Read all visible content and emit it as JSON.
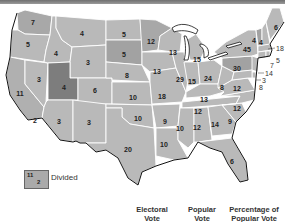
{
  "map": {
    "title": "",
    "colors": {
      "state_light": "#b9b9b9",
      "state_medium": "#a4a4a4",
      "state_dark": "#7d7d7d",
      "border": "#ffffff",
      "coastline": "#111111"
    },
    "states": {
      "WA": "7",
      "OR": "5",
      "CA": "11",
      "CA_divided": "2",
      "NV": "3",
      "ID": "4",
      "MT": "4",
      "WY": "3",
      "UT": "4",
      "CO": "6",
      "AZ": "3",
      "NM": "3",
      "ND": "5",
      "SD": "5",
      "NE": "8",
      "KS": "10",
      "OK": "10",
      "TX": "20",
      "MN": "12",
      "IA": "13",
      "MO": "18",
      "AR": "9",
      "LA": "10",
      "WI": "13",
      "IL": "29",
      "MI": "15",
      "IN": "15",
      "OH": "24",
      "KY": "13",
      "TN": "12",
      "MS": "10",
      "AL": "12",
      "GA": "14",
      "FL": "6",
      "SC": "9",
      "NC": "12",
      "VA": "12",
      "WV": "8",
      "PA": "30",
      "NY": "45",
      "VT": "4",
      "NH": "4",
      "ME": "6",
      "MA": "18",
      "RI": "5",
      "CT": "7",
      "NJ": "14",
      "DE": "3",
      "MD": "8"
    }
  },
  "legend": {
    "divided_top": "11",
    "divided_bottom": "2",
    "divided_label": "Divided"
  },
  "columns": {
    "electoral": [
      "Electoral",
      "Vote"
    ],
    "popular": [
      "Popular",
      "Vote"
    ],
    "percentage": [
      "Percentage of",
      "Popular Vote"
    ]
  }
}
